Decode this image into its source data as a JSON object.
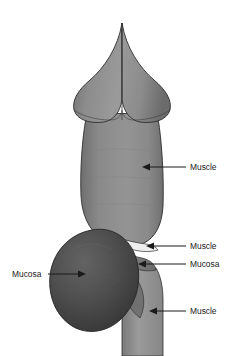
{
  "figure": {
    "background_color": "#ffffff",
    "canvas": {
      "width": 246,
      "height": 356
    }
  },
  "colors": {
    "muscle_body": "#8a8a8a",
    "muscle_body_dark": "#6f6f6f",
    "muscle_body_light": "#a2a2a2",
    "top_lobe": "#8c8c8c",
    "top_lobe_shadow": "#6b6b6b",
    "mucosa_bulb": "#4f4f4f",
    "mucosa_bulb_dark": "#3a3a3a",
    "mucosa_bulb_light": "#636363",
    "stem": "#949494",
    "stem_shadow": "#7a7a7a",
    "outline": "#2e2e2e",
    "notch_highlight": "#f2f2f2",
    "leader_line": "#1a1a1a",
    "label_text": "#1a1a1a"
  },
  "structures": [
    {
      "name": "upper-lobes",
      "label": "upper lobed segment"
    },
    {
      "name": "main-body",
      "label": "main muscular body"
    },
    {
      "name": "mucosa-bulb",
      "label": "mucosa bulb"
    },
    {
      "name": "lower-stem",
      "label": "lower stem"
    }
  ],
  "annotations": [
    {
      "id": "muscle-upper",
      "text": "Muscle",
      "text_x": 190,
      "text_y": 170,
      "anchor": "start",
      "leader": {
        "x1": 186,
        "y1": 167,
        "x2": 148,
        "y2": 167
      },
      "arrow": {
        "x": 142,
        "y": 167,
        "dir": "left"
      }
    },
    {
      "id": "muscle-middle",
      "text": "Muscle",
      "text_x": 190,
      "text_y": 249,
      "anchor": "start",
      "leader": {
        "x1": 186,
        "y1": 246,
        "x2": 152,
        "y2": 246
      },
      "arrow": {
        "x": 146,
        "y": 246,
        "dir": "left"
      }
    },
    {
      "id": "mucosa-right",
      "text": "Mucosa",
      "text_x": 190,
      "text_y": 267,
      "anchor": "start",
      "leader": {
        "x1": 186,
        "y1": 264,
        "x2": 144,
        "y2": 264
      },
      "arrow": {
        "x": 138,
        "y": 264,
        "dir": "left"
      }
    },
    {
      "id": "muscle-lower",
      "text": "Muscle",
      "text_x": 190,
      "text_y": 314,
      "anchor": "start",
      "leader": {
        "x1": 186,
        "y1": 311,
        "x2": 155,
        "y2": 311
      },
      "arrow": {
        "x": 149,
        "y": 311,
        "dir": "left"
      }
    },
    {
      "id": "mucosa-left",
      "text": "Mucosa",
      "text_x": 12,
      "text_y": 277,
      "anchor": "start",
      "leader": {
        "x1": 48,
        "y1": 274,
        "x2": 80,
        "y2": 274
      },
      "arrow": {
        "x": 86,
        "y": 274,
        "dir": "right"
      }
    }
  ]
}
